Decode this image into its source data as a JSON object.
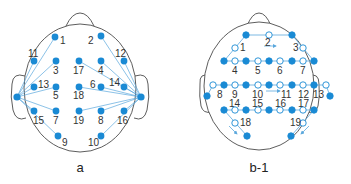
{
  "colors": {
    "electrode": "#1a8ad4",
    "line": "#5aa7dc",
    "outline": "#333333",
    "label": "#333333"
  },
  "panels": [
    {
      "caption": "a",
      "electrodes": [
        {
          "id": "1",
          "x": 55,
          "y": 37,
          "lx": 60,
          "ly": 44
        },
        {
          "id": "2",
          "x": 101,
          "y": 36,
          "lx": 88,
          "ly": 44
        },
        {
          "id": "11",
          "x": 34,
          "y": 61,
          "lx": 28,
          "ly": 57
        },
        {
          "id": "3",
          "x": 56,
          "y": 61,
          "lx": 53,
          "ly": 74
        },
        {
          "id": "17",
          "x": 79,
          "y": 61,
          "lx": 73,
          "ly": 74
        },
        {
          "id": "4",
          "x": 101,
          "y": 61,
          "lx": 98,
          "ly": 74
        },
        {
          "id": "12",
          "x": 124,
          "y": 61,
          "lx": 115,
          "ly": 57
        },
        {
          "id": "13",
          "x": 34,
          "y": 87,
          "lx": 38,
          "ly": 88
        },
        {
          "id": "5",
          "x": 56,
          "y": 87,
          "lx": 53,
          "ly": 99
        },
        {
          "id": "18",
          "x": 79,
          "y": 87,
          "lx": 73,
          "ly": 99
        },
        {
          "id": "6",
          "x": 101,
          "y": 87,
          "lx": 90,
          "ly": 88
        },
        {
          "id": "14",
          "x": 124,
          "y": 87,
          "lx": 109,
          "ly": 86
        },
        {
          "id": "15",
          "x": 34,
          "y": 111,
          "lx": 33,
          "ly": 124
        },
        {
          "id": "7",
          "x": 56,
          "y": 111,
          "lx": 53,
          "ly": 124
        },
        {
          "id": "19",
          "x": 79,
          "y": 111,
          "lx": 73,
          "ly": 124
        },
        {
          "id": "8",
          "x": 101,
          "y": 111,
          "lx": 98,
          "ly": 124
        },
        {
          "id": "16",
          "x": 124,
          "y": 111,
          "lx": 117,
          "ly": 124
        },
        {
          "id": "9",
          "x": 58,
          "y": 136,
          "lx": 62,
          "ly": 146
        },
        {
          "id": "10",
          "x": 101,
          "y": 136,
          "lx": 88,
          "ly": 146
        }
      ],
      "references": [
        {
          "name": "left-ear",
          "x": 17,
          "y": 97
        },
        {
          "name": "right-ear",
          "x": 141,
          "y": 97
        }
      ],
      "connections_left": [
        "1",
        "11",
        "3",
        "13",
        "5",
        "15",
        "7",
        "9"
      ],
      "connections_right": [
        "2",
        "12",
        "4",
        "17",
        "14",
        "6",
        "18",
        "19",
        "8",
        "16",
        "10"
      ]
    },
    {
      "caption": "b-1",
      "channels": [
        "1",
        "2",
        "3",
        "4",
        "5",
        "6",
        "7",
        "8",
        "9",
        "10",
        "11",
        "12",
        "13",
        "14",
        "15",
        "16",
        "17",
        "18",
        "19"
      ]
    }
  ]
}
